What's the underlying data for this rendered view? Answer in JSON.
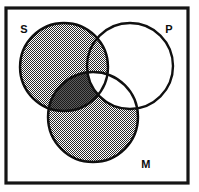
{
  "figure": {
    "kind": "three-circle-venn-diagram",
    "width": 199,
    "height": 192,
    "background_color": "#ffffff",
    "frame": {
      "stroke_color": "#151515",
      "x": 6,
      "y": 8,
      "width": 182,
      "height": 175
    }
  },
  "labels": {
    "s": "S",
    "p": "P",
    "m": "M"
  },
  "label_positions": {
    "s": {
      "x": 24,
      "y": 33
    },
    "p": {
      "x": 169,
      "y": 33
    },
    "m": {
      "x": 146,
      "y": 168
    }
  },
  "circles": [
    {
      "id": "S",
      "label": "S",
      "cx": 64,
      "cy": 67,
      "r": 44,
      "stroke_color": "#101010"
    },
    {
      "id": "P",
      "label": "P",
      "cx": 130,
      "cy": 66,
      "r": 43,
      "stroke_color": "#101010"
    },
    {
      "id": "M",
      "label": "M",
      "cx": 93,
      "cy": 117,
      "r": 45,
      "stroke_color": "#101010"
    }
  ],
  "shading": {
    "medium_gray": "#8d8d8d",
    "dark_gray": "#4a4a4a",
    "white": "#ffffff"
  },
  "regions": [
    {
      "id": "S-only",
      "name": "S only",
      "fill": "medium_gray"
    },
    {
      "id": "S-and-P",
      "name": "S intersect P only",
      "fill": "medium_gray"
    },
    {
      "id": "S-and-M",
      "name": "S intersect M only",
      "fill": "dark_gray"
    },
    {
      "id": "S-and-P-and-M",
      "name": "S intersect P intersect M",
      "fill": "white"
    },
    {
      "id": "P-only",
      "name": "P only",
      "fill": "white"
    },
    {
      "id": "P-and-M",
      "name": "P intersect M only",
      "fill": "white"
    },
    {
      "id": "M-only",
      "name": "M only",
      "fill": "medium_gray"
    }
  ]
}
